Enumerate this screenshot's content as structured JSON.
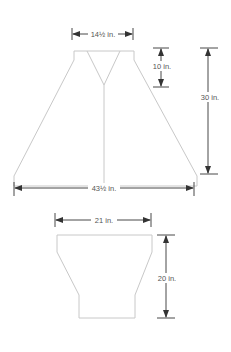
{
  "diagram": {
    "type": "knitting schematic",
    "pieces": [
      {
        "name": "cape-body",
        "measurements": {
          "neck_width": "14½ in.",
          "neck_depth": "10 in.",
          "length": "30 in.",
          "bottom_width": "43½ in."
        }
      },
      {
        "name": "collar-piece",
        "measurements": {
          "top_width": "21 in.",
          "height": "20 in."
        }
      }
    ],
    "colors": {
      "outline": "#c8c8c8",
      "dimension_lines": "#333333",
      "label_text": "#555555"
    }
  }
}
